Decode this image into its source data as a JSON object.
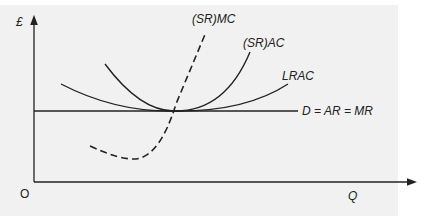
{
  "diagram": {
    "y_axis_label": "£",
    "x_axis_label": "Q",
    "origin_label": "O",
    "curves": {
      "srmc": "(SR)MC",
      "srac": "(SR)AC",
      "lrac": "LRAC",
      "demand": "D = AR = MR"
    }
  }
}
